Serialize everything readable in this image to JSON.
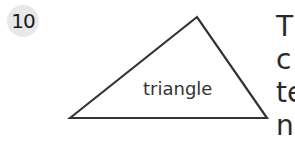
{
  "question": {
    "number": "10",
    "shape_label": "triangle",
    "side_text_lines": [
      "T",
      "c",
      "te",
      "n"
    ]
  },
  "colors": {
    "badge_bg": "#e8e8e8",
    "stroke": "#333333"
  }
}
